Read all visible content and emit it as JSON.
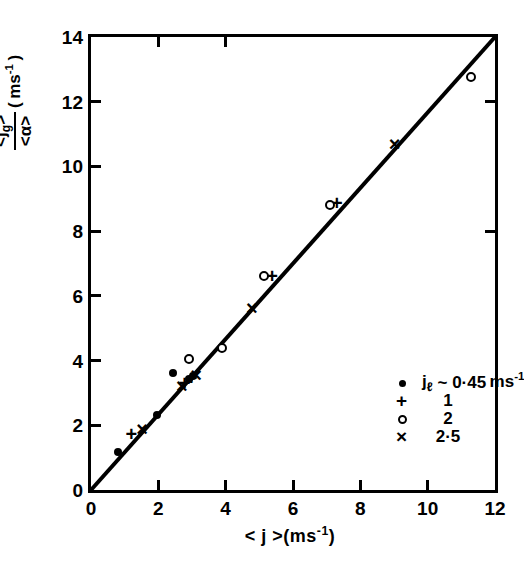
{
  "chart_data": {
    "type": "scatter",
    "title": "",
    "xlabel": "<j>(ms-1)",
    "ylabel": "<jg>/<a> (ms-1)",
    "xlim": [
      0,
      12
    ],
    "ylim": [
      0,
      14
    ],
    "xticks": [
      "0",
      "2",
      "4",
      "6",
      "8",
      "10",
      "12"
    ],
    "xtick_values": [
      0,
      2,
      4,
      6,
      8,
      10,
      12
    ],
    "yticks": [
      "0",
      "2",
      "4",
      "6",
      "8",
      "10",
      "12",
      "14"
    ],
    "ytick_values": [
      0,
      2,
      4,
      6,
      8,
      10,
      12,
      14
    ],
    "grid": false,
    "legend_position": "lower-right-inside",
    "fit_line": {
      "x0": 0,
      "y0": 0,
      "x1": 12,
      "y1": 14
    },
    "series": [
      {
        "name": "jl ~ 0.45 ms-1",
        "marker": "filled-circle",
        "points": [
          [
            0.8,
            1.18
          ],
          [
            1.95,
            2.32
          ],
          [
            2.45,
            3.62
          ],
          [
            2.92,
            3.44
          ],
          [
            3.02,
            3.52
          ]
        ]
      },
      {
        "name": "1",
        "marker": "plus",
        "points": [
          [
            1.2,
            1.72
          ],
          [
            2.78,
            3.3
          ],
          [
            2.98,
            3.46
          ],
          [
            5.38,
            6.62
          ],
          [
            7.3,
            8.86
          ]
        ]
      },
      {
        "name": "2",
        "marker": "open-circle",
        "points": [
          [
            2.9,
            4.05
          ],
          [
            3.9,
            4.38
          ],
          [
            5.15,
            6.62
          ],
          [
            7.1,
            8.82
          ],
          [
            11.3,
            12.75
          ]
        ]
      },
      {
        "name": "2.5",
        "marker": "cross",
        "points": [
          [
            1.52,
            1.88
          ],
          [
            2.7,
            3.22
          ],
          [
            3.12,
            3.55
          ],
          [
            4.78,
            5.62
          ],
          [
            9.02,
            10.7
          ]
        ]
      }
    ]
  },
  "axes": {
    "x_title_parts": {
      "quantity": "< j >",
      "units": "(ms",
      "exp": "-1",
      "close": ")"
    },
    "y_title_parts": {
      "numerator": "<j",
      "num_sub": "g",
      "num_close": ">",
      "denominator": "<α>",
      "units": "( ms",
      "exp": "-1",
      "close": " )"
    }
  },
  "legend": {
    "rows": [
      {
        "symbol": "filled-circle",
        "symbol_glyph": "•",
        "label_lead": "j",
        "label_sub": "ℓ",
        "label_tilde": "~",
        "value": "0·45",
        "units": "ms",
        "exp": "-1"
      },
      {
        "symbol": "plus",
        "symbol_glyph": "+",
        "label_lead": "",
        "label_sub": "",
        "label_tilde": "",
        "value": "1",
        "units": "",
        "exp": ""
      },
      {
        "symbol": "open-circle",
        "symbol_glyph": "o",
        "label_lead": "",
        "label_sub": "",
        "label_tilde": "",
        "value": "2",
        "units": "",
        "exp": ""
      },
      {
        "symbol": "cross",
        "symbol_glyph": "×",
        "label_lead": "",
        "label_sub": "",
        "label_tilde": "",
        "value": "2·5",
        "units": "",
        "exp": ""
      }
    ]
  },
  "colors": {
    "ink": "#000000",
    "paper": "#ffffff"
  }
}
